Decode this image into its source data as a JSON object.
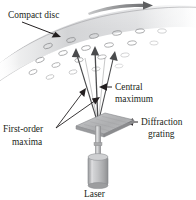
{
  "figure": {
    "background_color": "#ffffff",
    "ink_color": "#231f20",
    "disc_color": "#d8d9da",
    "grating_color": "#b3b4b6",
    "laser_color": "#b9babc"
  },
  "labels": {
    "compact_disc": "Compact disc",
    "central_maximum_line1": "Central",
    "central_maximum_line2": "maximum",
    "diffraction_grating_line1": "Diffraction",
    "diffraction_grating_line2": "grating",
    "first_order_line1": "First-order",
    "first_order_line2": "maxima",
    "laser": "Laser"
  },
  "annotations": {
    "rotation_arrow": "rotation-direction-arrow",
    "compact_disc_pointer": "leader-line-to-disc",
    "central_maximum_pointer": "arrow-pointing-left-to-central-beam",
    "diffraction_grating_pointer": "arrow-pointing-left-to-grating",
    "first_order_pointer": "leader-lines-to-side-beams"
  },
  "optics": {
    "beam_count": 3,
    "beam_names": [
      "first-order-maximum-left",
      "central-maximum",
      "first-order-maximum-right"
    ],
    "pit_rows": 4,
    "pits_per_row": [
      6,
      6,
      5,
      4
    ]
  }
}
